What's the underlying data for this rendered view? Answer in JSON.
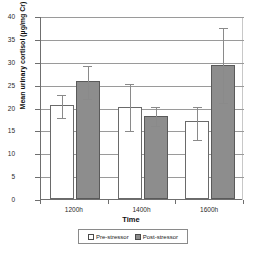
{
  "chart_data": {
    "type": "bar",
    "title": "",
    "xlabel": "Time",
    "ylabel": "Mean urinary cortisol (µg/mg Cr)",
    "categories": [
      "1200h",
      "1400h",
      "1600h"
    ],
    "ylim": [
      0,
      40
    ],
    "yticks": [
      0,
      5,
      10,
      15,
      20,
      25,
      30,
      35,
      40
    ],
    "ytick_labels": [
      "0",
      "5",
      "10",
      "15",
      "20",
      "25",
      "30",
      "35",
      "40"
    ],
    "grid": "horizontal",
    "legend_position": "bottom",
    "series": [
      {
        "name": "Pre-stressor",
        "color": "#ffffff",
        "values": [
          20.5,
          20.2,
          17.0
        ],
        "error_low": [
          18.0,
          15.0,
          13.2
        ],
        "error_high": [
          23.0,
          25.3,
          20.4
        ]
      },
      {
        "name": "Post-stressor",
        "color": "#8d8d8d",
        "values": [
          25.7,
          18.1,
          29.3
        ],
        "error_low": [
          22.0,
          16.2,
          21.3
        ],
        "error_high": [
          29.3,
          20.3,
          37.5
        ]
      }
    ]
  }
}
